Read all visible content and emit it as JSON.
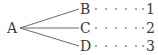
{
  "diagram": {
    "type": "tree",
    "root": {
      "label": "A",
      "x": 13,
      "y": 28
    },
    "branches": [
      {
        "label": "B",
        "value": "1",
        "y": 9
      },
      {
        "label": "C",
        "value": "2",
        "y": 28
      },
      {
        "label": "D",
        "value": "3",
        "y": 46
      }
    ],
    "line_color": "#6a6a6a",
    "text_color": "#3a3a3a"
  }
}
